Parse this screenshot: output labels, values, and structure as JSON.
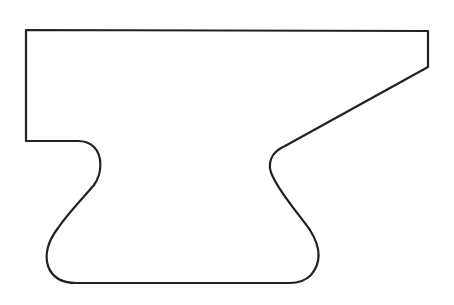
{
  "figure": {
    "stroke_color": "#222222",
    "fill_color": "#ffffff",
    "background": "#ffffff",
    "stroke_width": 2.2
  }
}
